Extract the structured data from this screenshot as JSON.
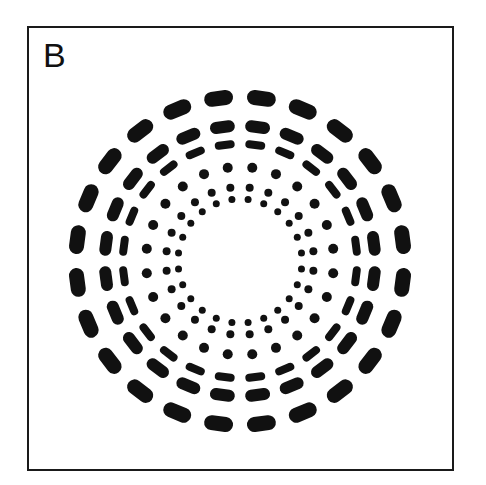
{
  "panel": {
    "label": "B"
  },
  "colors": {
    "background": "#ffffff",
    "ink": "#111111",
    "frame": "#1a1a1a"
  },
  "pattern": {
    "center": [
      240,
      261
    ],
    "elements_per_ring": 24,
    "angle_offset_deg": 7.5,
    "rings": [
      {
        "name": "ring-1-outer-dashes",
        "shape": "dash",
        "radius": 164,
        "length": 29,
        "thickness": 15
      },
      {
        "name": "ring-2-dashes",
        "shape": "dash",
        "radius": 135,
        "length": 25,
        "thickness": 12
      },
      {
        "name": "ring-3-dashes",
        "shape": "dash",
        "radius": 117,
        "length": 20,
        "thickness": 8
      },
      {
        "name": "ring-4-dots",
        "shape": "dot",
        "radius": 94,
        "diameter": 10
      },
      {
        "name": "ring-5-dots",
        "shape": "dot",
        "radius": 74,
        "diameter": 8
      },
      {
        "name": "ring-6-dots",
        "shape": "dot",
        "radius": 62,
        "diameter": 7
      }
    ]
  }
}
